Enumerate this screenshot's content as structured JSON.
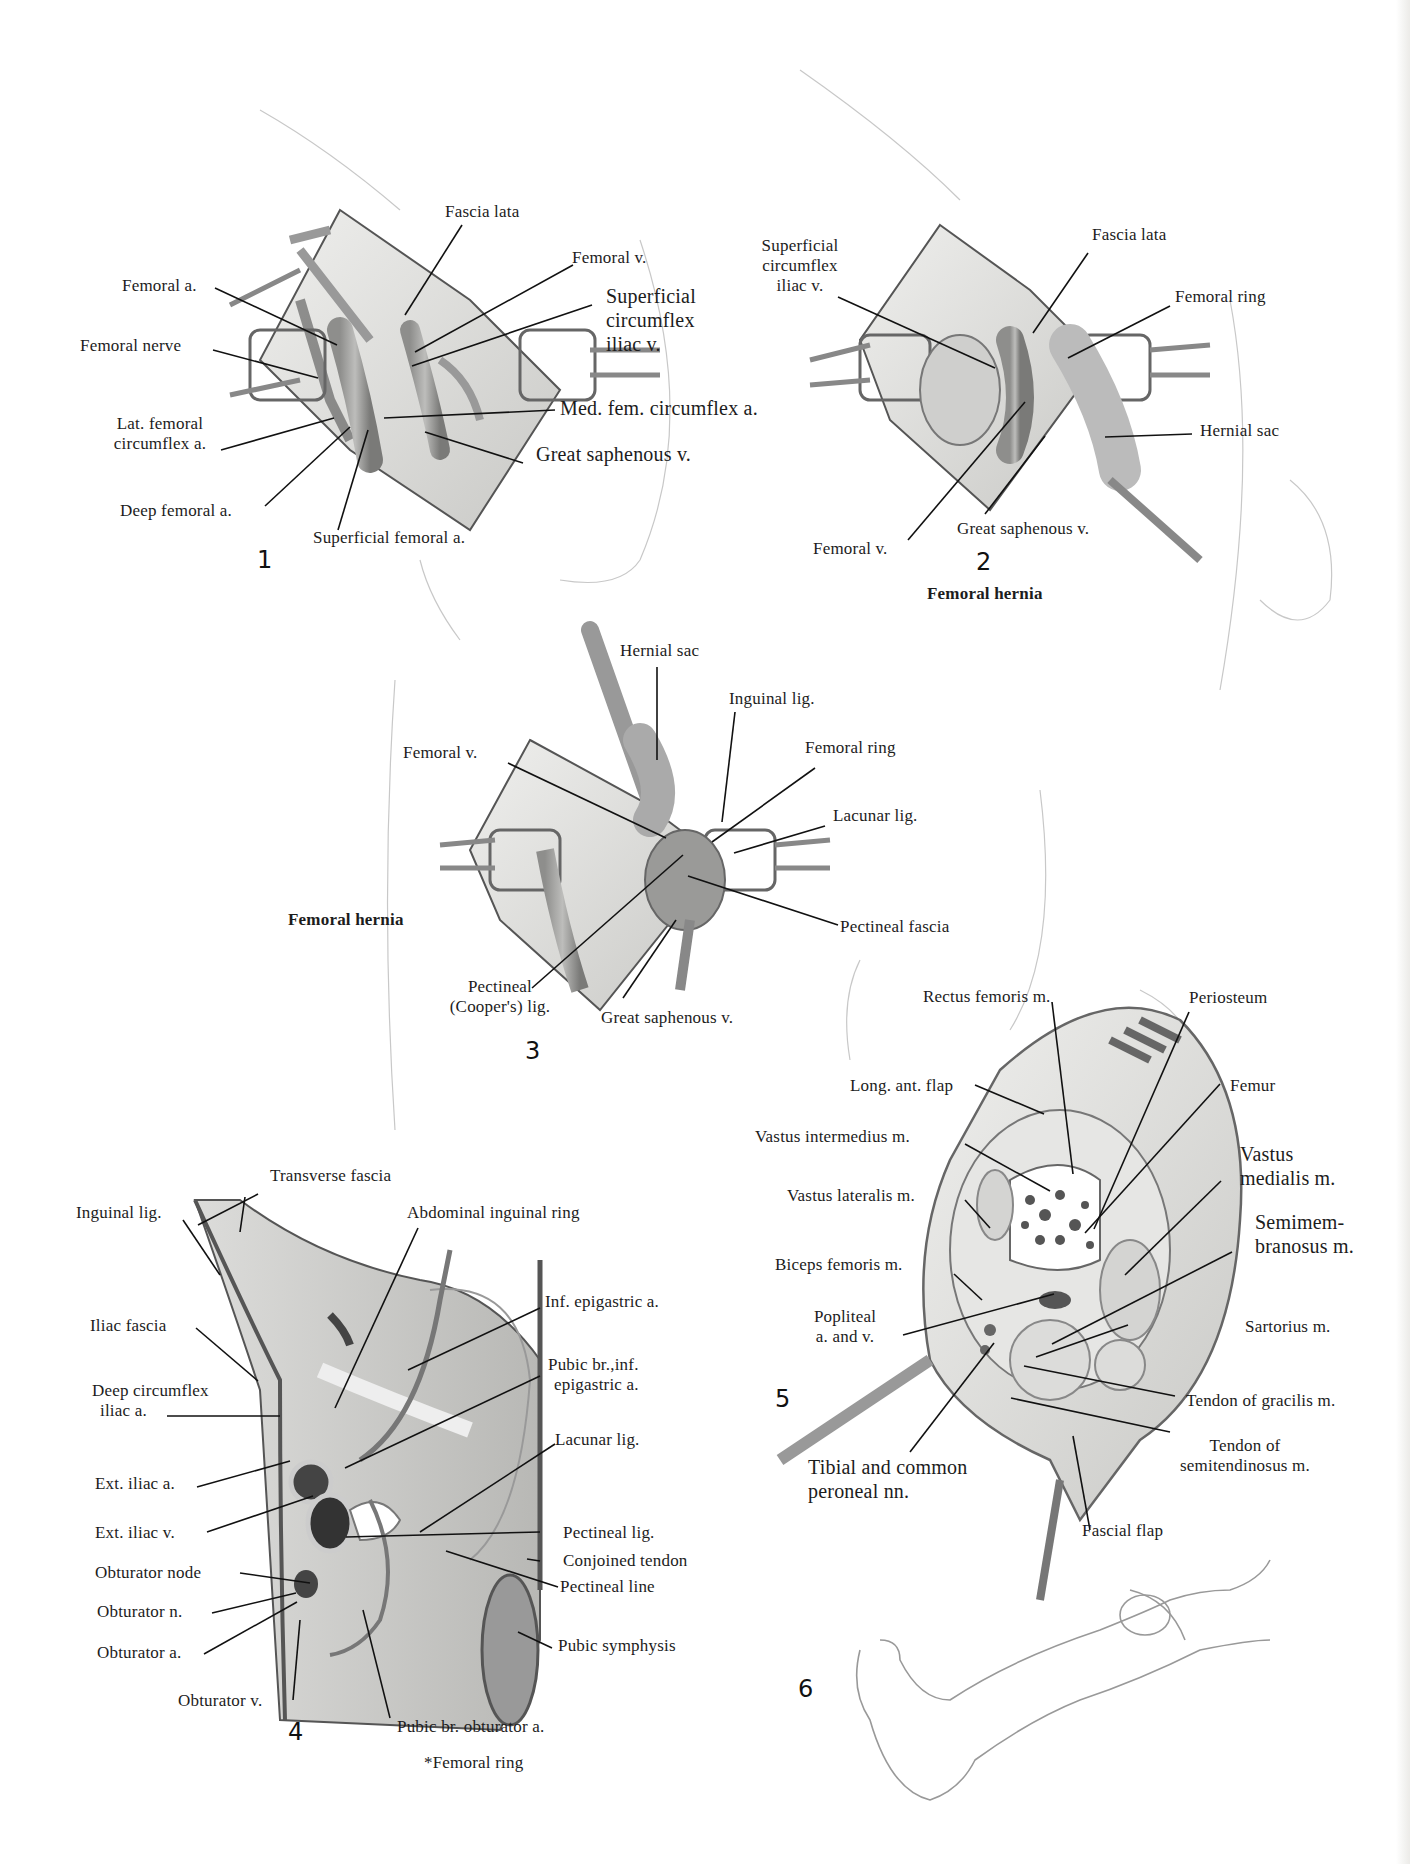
{
  "page": {
    "footnote": "*Femoral ring"
  },
  "figures": [
    {
      "number": "1",
      "caption": "",
      "labels": {
        "femoral_a": "Femoral a.",
        "femoral_nerve": "Femoral nerve",
        "lat_femoral_circumflex_1": "Lat. femoral",
        "lat_femoral_circumflex_2": "circumflex a.",
        "deep_femoral_a": "Deep femoral a.",
        "superficial_femoral_a": "Superficial femoral a.",
        "fascia_lata": "Fascia lata",
        "femoral_v": "Femoral v.",
        "superficial_circumflex_iliac_v_1": "Superficial",
        "superficial_circumflex_iliac_v_2": "circumflex",
        "superficial_circumflex_iliac_v_3": "iliac v.",
        "med_fem_circumflex_a": "Med. fem. circumflex a.",
        "great_saphenous_v": "Great saphenous v."
      }
    },
    {
      "number": "2",
      "caption": "Femoral hernia",
      "labels": {
        "superficial_circumflex_iliac_v_1": "Superficial",
        "superficial_circumflex_iliac_v_2": "circumflex",
        "superficial_circumflex_iliac_v_3": "iliac v.",
        "fascia_lata": "Fascia lata",
        "femoral_ring": "Femoral ring",
        "hernial_sac": "Hernial sac",
        "great_saphenous_v": "Great saphenous v.",
        "femoral_v": "Femoral v."
      }
    },
    {
      "number": "3",
      "caption": "Femoral hernia",
      "labels": {
        "hernial_sac": "Hernial sac",
        "inguinal_lig": "Inguinal lig.",
        "femoral_v": "Femoral v.",
        "femoral_ring": "Femoral ring",
        "lacunar_lig": "Lacunar lig.",
        "pectineal_fascia": "Pectineal fascia",
        "pectineal_coopers_lig_1": "Pectineal",
        "pectineal_coopers_lig_2": "(Cooper's) lig.",
        "great_saphenous_v": "Great saphenous v."
      }
    },
    {
      "number": "4",
      "caption": "",
      "labels": {
        "transverse_fascia": "Transverse fascia",
        "inguinal_lig": "Inguinal lig.",
        "abdominal_inguinal_ring": "Abdominal inguinal ring",
        "inf_epigastric_a": "Inf. epigastric a.",
        "iliac_fascia": "Iliac fascia",
        "pubic_br_inf_epigastric_1": "Pubic br.,inf.",
        "pubic_br_inf_epigastric_2": "epigastric a.",
        "deep_circumflex_iliac_1": "Deep circumflex",
        "deep_circumflex_iliac_2": "iliac a.",
        "lacunar_lig": "Lacunar lig.",
        "ext_iliac_a": "Ext. iliac a.",
        "ext_iliac_v": "Ext. iliac v.",
        "pectineal_lig": "Pectineal lig.",
        "conjoined_tendon": "Conjoined tendon",
        "obturator_node": "Obturator node",
        "pectineal_line": "Pectineal line",
        "obturator_n": "Obturator n.",
        "obturator_a": "Obturator a.",
        "pubic_symphysis": "Pubic symphysis",
        "obturator_v": "Obturator v.",
        "pubic_br_obturator_a": "Pubic br. obturator a."
      }
    },
    {
      "number": "5",
      "caption": "",
      "labels": {
        "rectus_femoris": "Rectus femoris m.",
        "periosteum": "Periosteum",
        "long_ant_flap": "Long. ant. flap",
        "femur": "Femur",
        "vastus_intermedius": "Vastus intermedius  m.",
        "vastus_medialis_1": "Vastus",
        "vastus_medialis_2": "medialis m.",
        "vastus_lateralis": "Vastus lateralis  m.",
        "semimembranosus_1": "Semimem-",
        "semimembranosus_2": "branosus m.",
        "biceps_femoris": "Biceps femoris m.",
        "popliteal_1": "Popliteal",
        "popliteal_2": "a. and v.",
        "sartorius": "Sartorius  m.",
        "tendon_gracilis": "Tendon of gracilis m.",
        "tibial_peroneal_1": "Tibial and common",
        "tibial_peroneal_2": "peroneal nn.",
        "tendon_semitendinosus_1": "Tendon of",
        "tendon_semitendinosus_2": "semitendinosus  m.",
        "fascial_flap": "Fascial flap"
      }
    },
    {
      "number": "6",
      "caption": "",
      "labels": {}
    }
  ]
}
